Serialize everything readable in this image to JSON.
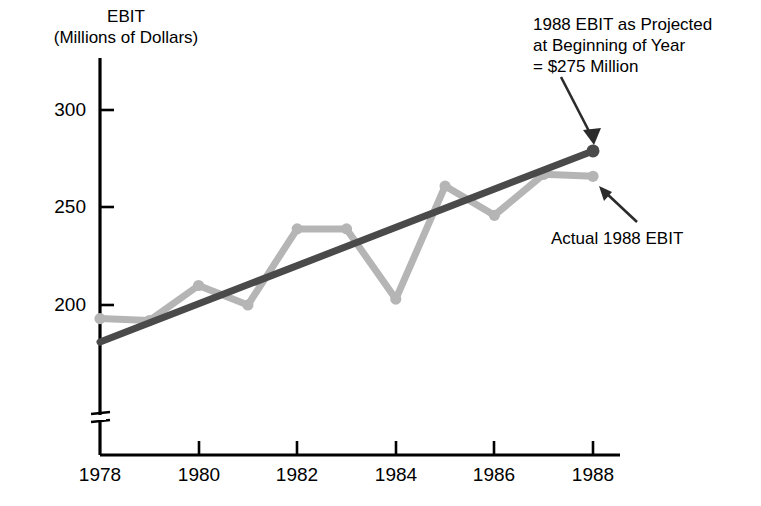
{
  "chart_data": {
    "type": "line",
    "title": "",
    "ylabel": "EBIT\n(Millions of Dollars)",
    "ylabel_line1": "EBIT",
    "ylabel_line2": "(Millions of Dollars)",
    "xlabel": "",
    "x": [
      1978,
      1979,
      1980,
      1981,
      1982,
      1983,
      1984,
      1985,
      1986,
      1987,
      1988
    ],
    "xtick_labels": [
      "1978",
      "1980",
      "1982",
      "1984",
      "1986",
      "1988"
    ],
    "xticks": [
      1978,
      1980,
      1982,
      1984,
      1986,
      1988
    ],
    "ytick_labels": [
      "200",
      "250",
      "300"
    ],
    "yticks": [
      200,
      250,
      300
    ],
    "xlim": [
      1978,
      1988
    ],
    "ylim": [
      175,
      310
    ],
    "grid": false,
    "legend": "none",
    "axis_break_y": true,
    "series": [
      {
        "name": "Actual EBIT",
        "color": "#b5b5b5",
        "marker": "circle",
        "values": [
          193,
          192,
          210,
          200,
          239,
          239,
          203,
          261,
          246,
          267,
          266
        ]
      },
      {
        "name": "Projected EBIT Trend",
        "color": "#4a4a4a",
        "marker": "circle-end",
        "values": [
          181,
          191,
          201,
          211,
          221,
          230,
          240,
          250,
          260,
          269,
          279
        ]
      }
    ],
    "annotations": [
      {
        "name": "projected-ebit",
        "text": "1988 EBIT as Projected\nat Beginning of Year\n= $275 Million",
        "line1": "1988 EBIT as Projected",
        "line2": "at Beginning of Year",
        "line3": "= $275 Million",
        "points_to_x": 1988,
        "points_to_y": 279
      },
      {
        "name": "actual-ebit",
        "text": "Actual 1988 EBIT",
        "line1": "Actual 1988 EBIT",
        "points_to_x": 1988,
        "points_to_y": 266
      }
    ],
    "colors": {
      "actual_line": "#b5b5b5",
      "projected_line": "#4a4a4a",
      "axis": "#000000",
      "text": "#000000",
      "background": "#ffffff"
    }
  }
}
